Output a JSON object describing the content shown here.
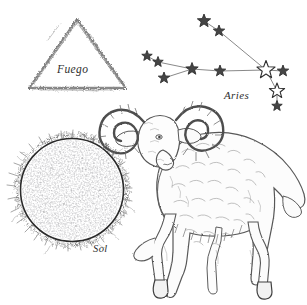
{
  "plate": {
    "title": "Aries astrological plate",
    "background_color": "#ffffff",
    "ink_color": "#4a4a4a",
    "line_color": "#3a3a3a"
  },
  "labels": {
    "fire_element": "Fuego",
    "constellation": "Aries",
    "sun": "Sol"
  },
  "figures": {
    "fire_triangle": {
      "name": "fire-element-triangle",
      "shape": "triangle",
      "apex": [
        77,
        18
      ],
      "left_base": [
        28,
        88
      ],
      "right_base": [
        126,
        88
      ],
      "style": "rough hand-drawn charcoal stroke"
    },
    "sun": {
      "name": "sun-disc",
      "center": [
        72,
        190
      ],
      "radius": 52,
      "texture": "stipple",
      "corona": "spiky radial flares"
    },
    "ram": {
      "name": "aries-ram",
      "pose": "standing, head turned toward viewer",
      "features": [
        "curled ridged horns",
        "shaggy fleece",
        "cloven hooves",
        "short tail"
      ],
      "bounds": [
        118,
        103,
        307,
        300
      ]
    }
  },
  "chart_data": {
    "type": "scatter",
    "title": "Aries",
    "xlabel": "",
    "ylabel": "",
    "xlim": [
      140,
      307
    ],
    "ylim": [
      0,
      110
    ],
    "grid": false,
    "legend": null,
    "stars": [
      {
        "id": "s1",
        "name": "41-Arietis",
        "x": 204,
        "y": 21,
        "size": 7.0,
        "fill": "solid"
      },
      {
        "id": "s2",
        "name": "35-Arietis",
        "x": 219,
        "y": 31,
        "size": 6.0,
        "fill": "solid"
      },
      {
        "id": "s3",
        "name": "19-Arietis",
        "x": 147,
        "y": 56,
        "size": 5.5,
        "fill": "solid"
      },
      {
        "id": "s4",
        "name": "14-Arietis",
        "x": 158,
        "y": 62,
        "size": 5.5,
        "fill": "solid"
      },
      {
        "id": "s5",
        "name": "iota-Arietis",
        "x": 164,
        "y": 78,
        "size": 6.0,
        "fill": "solid"
      },
      {
        "id": "s6",
        "name": "Bharani",
        "x": 192,
        "y": 69,
        "size": 6.5,
        "fill": "solid"
      },
      {
        "id": "s7",
        "name": "Mesarthim",
        "x": 220,
        "y": 71,
        "size": 6.0,
        "fill": "solid"
      },
      {
        "id": "s8",
        "name": "Hamal",
        "x": 266,
        "y": 70,
        "size": 9.5,
        "fill": "open"
      },
      {
        "id": "s9",
        "name": "Sheratan",
        "x": 283,
        "y": 71,
        "size": 6.0,
        "fill": "solid"
      },
      {
        "id": "s10",
        "name": "delta-Arietis",
        "x": 277,
        "y": 91,
        "size": 8.0,
        "fill": "open"
      },
      {
        "id": "s11",
        "name": "zeta-Arietis",
        "x": 277,
        "y": 106,
        "size": 5.5,
        "fill": "solid"
      }
    ],
    "edges": [
      [
        "s1",
        "s2"
      ],
      [
        "s2",
        "s8"
      ],
      [
        "s3",
        "s4"
      ],
      [
        "s4",
        "s6"
      ],
      [
        "s5",
        "s6"
      ],
      [
        "s6",
        "s7"
      ],
      [
        "s7",
        "s8"
      ],
      [
        "s8",
        "s9"
      ],
      [
        "s8",
        "s10"
      ],
      [
        "s10",
        "s11"
      ]
    ]
  }
}
